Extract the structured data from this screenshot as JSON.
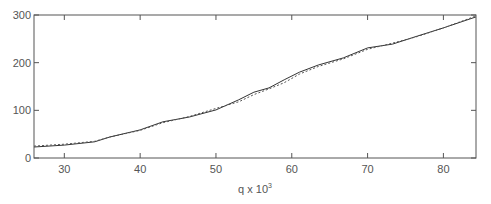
{
  "chart_data": {
    "type": "line",
    "title": "",
    "xlabel": "q x 10",
    "xlabel_superscript": "3",
    "ylabel": "",
    "xlim": [
      26,
      84.3
    ],
    "ylim": [
      0,
      300
    ],
    "grid": false,
    "legend": null,
    "x_ticks": [
      30,
      40,
      50,
      60,
      70,
      80
    ],
    "y_ticks": [
      0,
      100,
      200,
      300
    ],
    "series": [
      {
        "name": "solid",
        "style": "solid",
        "color": "#333333",
        "x": [
          26,
          30,
          34,
          36,
          40,
          43,
          46.5,
          50,
          53,
          55,
          57,
          59,
          61,
          63.5,
          66.8,
          70,
          73.3,
          76.6,
          80,
          84.3
        ],
        "values": [
          23,
          27,
          34,
          44,
          59,
          76,
          86,
          101,
          122,
          138,
          147,
          164,
          180,
          195,
          210,
          231,
          239,
          256,
          273,
          296
        ]
      },
      {
        "name": "dashed",
        "style": "dotted",
        "color": "#555555",
        "x": [
          26,
          30,
          34,
          36,
          40,
          43,
          46.5,
          50,
          53,
          55,
          57,
          59,
          61,
          63.5,
          66.8,
          70,
          73.3,
          76.6,
          80,
          84.3
        ],
        "values": [
          25,
          29,
          35,
          44,
          58,
          74,
          87,
          104,
          118,
          133,
          145,
          158,
          176,
          192,
          208,
          228,
          241,
          255,
          273,
          298
        ]
      }
    ]
  }
}
